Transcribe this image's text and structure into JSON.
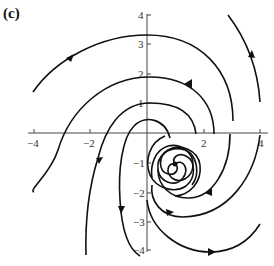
{
  "figure": {
    "panel_label": "(c)",
    "type": "phase-portrait",
    "equilibrium": {
      "x": 1,
      "y": -1,
      "kind": "spiral"
    },
    "x_axis": {
      "range": [
        -4,
        4
      ],
      "ticks": [
        -4,
        -2,
        2,
        4
      ],
      "tick_labels": [
        "−4",
        "−2",
        "2",
        "4"
      ]
    },
    "y_axis": {
      "range": [
        -4,
        4
      ],
      "ticks": [
        4,
        3,
        2,
        1,
        -1,
        -2,
        -3,
        -4
      ],
      "tick_labels": [
        "4",
        "3",
        "2",
        "1",
        "−1",
        "−2",
        "−3",
        "−4"
      ]
    },
    "trajectory_color": "#111111",
    "axis_color": "#444444"
  }
}
